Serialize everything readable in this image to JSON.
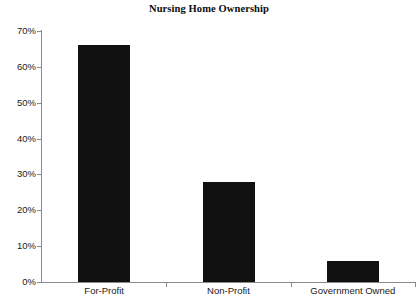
{
  "chart_data": {
    "type": "bar",
    "title": "Nursing Home Ownership",
    "xlabel": "",
    "ylabel": "",
    "categories": [
      "For-Profit",
      "Non-Profit",
      "Government Owned"
    ],
    "values": [
      66,
      28,
      6
    ],
    "ylim": [
      0,
      70
    ],
    "ytick_labels": [
      "0%",
      "10%",
      "20%",
      "30%",
      "40%",
      "50%",
      "60%",
      "70%"
    ],
    "ytick_values": [
      0,
      10,
      20,
      30,
      40,
      50,
      60,
      70
    ],
    "grid": false,
    "legend": null,
    "bar_color": "#111111",
    "axis_color": "#8a8a8a",
    "background": "#ffffff"
  }
}
